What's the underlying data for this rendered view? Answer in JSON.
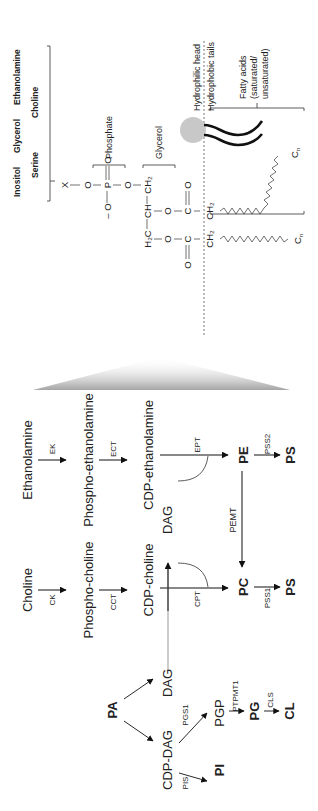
{
  "figure": {
    "orientation": "rotated -90deg",
    "pathway": {
      "precursors": {
        "choline": "Choline",
        "ethanolamine": "Ethanolamine",
        "phospho_choline": "Phospho-choline",
        "phospho_ethanolamine": "Phospho-ethanolamine",
        "cdp_choline": "CDP-choline",
        "cdp_ethanolamine": "CDP-ethanolamine",
        "dag_center": "DAG",
        "dag_left": "DAG",
        "cdp_dag": "CDP-DAG"
      },
      "enzymes": {
        "ck": "CK",
        "ek": "EK",
        "cct": "CCT",
        "ect": "ECT",
        "cpt": "CPT",
        "ept": "EPT",
        "pemt": "PEMT",
        "pss1": "PSS1",
        "pss2": "PSS2",
        "pgs1": "PGS1",
        "ptpmt1": "PTPMT1",
        "cls": "CLS",
        "pis": "PIS"
      },
      "products": {
        "pc": "PC",
        "pe": "PE",
        "ps_from_pc": "PS",
        "ps_from_pe": "PS",
        "pa": "PA",
        "pgp": "PGP",
        "pg": "PG",
        "cl": "CL",
        "pi": "PI"
      }
    },
    "structure": {
      "headgroups": [
        "Inositol",
        "Serine",
        "Glycerol",
        "Choline",
        "Ethanolamine"
      ],
      "x": "X",
      "phosphate_label": "Phosphate",
      "glycerol_label": "Glycerol",
      "fatty_acid_label_1": "Fatty acids",
      "fatty_acid_label_2": "(saturated/",
      "fatty_acid_label_3": "unsaturated)",
      "atoms": {
        "o": "O",
        "p": "P",
        "minus_o": "– O",
        "ch": "CH",
        "ch2": "CH₂",
        "h2c": "H₂C",
        "c": "C",
        "cn": "C",
        "n_sub": "n"
      }
    },
    "schematic": {
      "head_label": "Hydrophilic head",
      "tail_label": "Hydrophobic tails",
      "head_color": "#c8c8c8"
    }
  }
}
